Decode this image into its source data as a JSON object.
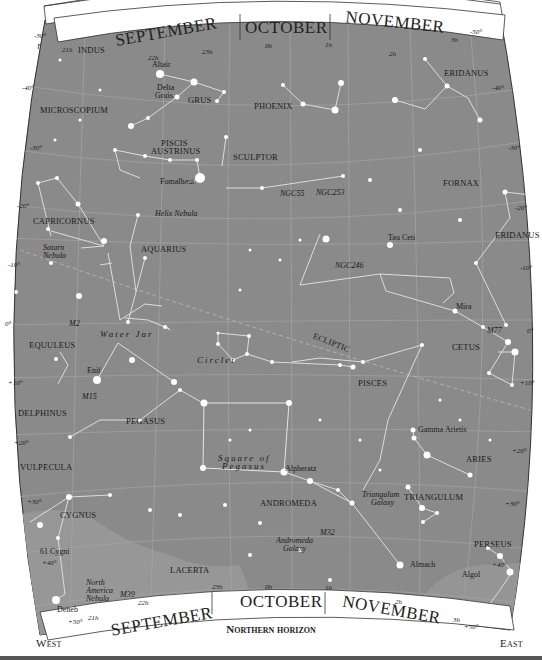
{
  "intro_text": [
    "rs at the",
    "the top",
    "lar",
    "h polar"
  ],
  "header": {
    "overhead": "Overhead"
  },
  "footer": {
    "horizon": "Northern horizon",
    "west": "West",
    "east": "East"
  },
  "months": {
    "top": [
      "SEPTEMBER",
      "OCTOBER",
      "NOVEMBER"
    ],
    "bottom": [
      "SEPTEMBER",
      "OCTOBER",
      "NOVEMBER"
    ]
  },
  "colors": {
    "sky": "#8a8a8a",
    "milky_way": "#9a9a9a",
    "lines": "#d8d8d8",
    "grid": "#a8a8a8",
    "star": "#ffffff",
    "banner": "#ffffff",
    "text": "#1a1a1a"
  },
  "ra_ticks": {
    "top": [
      "21h",
      "22h",
      "23h",
      "0h",
      "1h",
      "2h",
      "3h"
    ],
    "bottom": [
      "21h",
      "22h",
      "23h",
      "0h",
      "1h",
      "2h",
      "3h"
    ]
  },
  "dec_ticks": {
    "left": [
      "-30°",
      "-40°",
      "-30°",
      "-20°",
      "-10°",
      "0°",
      "+10°",
      "+20°",
      "+30°",
      "+40°",
      "+50°"
    ],
    "right": [
      "-50°",
      "-40°",
      "-30°",
      "-20°",
      "-10°",
      "0°",
      "+10°",
      "+20°",
      "+30°",
      "+40°",
      "+50°"
    ]
  },
  "constellations": [
    {
      "name": "INDUS",
      "x": 78,
      "y": 53
    },
    {
      "name": "GRUS",
      "x": 188,
      "y": 103
    },
    {
      "name": "PHOENIX",
      "x": 254,
      "y": 109
    },
    {
      "name": "ERIDANUS",
      "x": 445,
      "y": 76
    },
    {
      "name": "MICROSCOPIUM",
      "x": 40,
      "y": 113
    },
    {
      "name": "PISCIS",
      "x": 161,
      "y": 147
    },
    {
      "name": "AUSTRINUS",
      "x": 151,
      "y": 155
    },
    {
      "name": "SCULPTOR",
      "x": 233,
      "y": 160
    },
    {
      "name": "FORNAX",
      "x": 443,
      "y": 186
    },
    {
      "name": "CAPRICORNUS",
      "x": 33,
      "y": 224
    },
    {
      "name": "AQUARIUS",
      "x": 141,
      "y": 252
    },
    {
      "name": "ERIDANUS",
      "x": 495,
      "y": 238
    },
    {
      "name": "CETUS",
      "x": 452,
      "y": 350
    },
    {
      "name": "EQUULEUS",
      "x": 29,
      "y": 348
    },
    {
      "name": "PISCES",
      "x": 358,
      "y": 386
    },
    {
      "name": "DELPHINUS",
      "x": 18,
      "y": 416
    },
    {
      "name": "PEGASUS",
      "x": 126,
      "y": 424
    },
    {
      "name": "ARIES",
      "x": 466,
      "y": 462
    },
    {
      "name": "VULPECULA",
      "x": 20,
      "y": 470
    },
    {
      "name": "ANDROMEDA",
      "x": 260,
      "y": 506
    },
    {
      "name": "TRIANGULUM",
      "x": 404,
      "y": 500
    },
    {
      "name": "CYGNUS",
      "x": 60,
      "y": 518
    },
    {
      "name": "PERSEUS",
      "x": 474,
      "y": 547
    },
    {
      "name": "LACERTA",
      "x": 170,
      "y": 573
    }
  ],
  "deep_sky": [
    {
      "name": "NGC55",
      "x": 280,
      "y": 196
    },
    {
      "name": "NGC253",
      "x": 316,
      "y": 195
    },
    {
      "name": "Helix Nebula",
      "x": 155,
      "y": 216
    },
    {
      "name": "NGC246",
      "x": 335,
      "y": 268
    },
    {
      "name": "M77",
      "x": 487,
      "y": 333
    },
    {
      "name": "M2",
      "x": 69,
      "y": 323
    },
    {
      "name": "M15",
      "x": 82,
      "y": 396
    },
    {
      "name": "M32",
      "x": 320,
      "y": 533
    },
    {
      "name": "M39",
      "x": 120,
      "y": 596
    }
  ],
  "multiline_objects": [
    {
      "lines": [
        "Saturn",
        "Nebula"
      ],
      "x": 43,
      "y": 250
    },
    {
      "lines": [
        "Andromeda",
        "Galaxy"
      ],
      "x": 276,
      "y": 543
    },
    {
      "lines": [
        "Triangulum",
        "Galaxy"
      ],
      "x": 365,
      "y": 498
    },
    {
      "lines": [
        "North",
        "America",
        "Nebula"
      ],
      "x": 86,
      "y": 585
    }
  ],
  "star_names": [
    {
      "name": "Altair",
      "x": 152,
      "y": 67
    },
    {
      "name": "Fomalhaut",
      "x": 160,
      "y": 184
    },
    {
      "name": "Tau Ceti",
      "x": 388,
      "y": 240
    },
    {
      "name": "Mira",
      "x": 456,
      "y": 306
    },
    {
      "name": "Enif",
      "x": 87,
      "y": 373
    },
    {
      "name": "Gamma Arietis",
      "x": 418,
      "y": 432
    },
    {
      "name": "Alpheratz",
      "x": 285,
      "y": 471
    },
    {
      "name": "Almach",
      "x": 410,
      "y": 567
    },
    {
      "name": "Algol",
      "x": 462,
      "y": 577
    },
    {
      "name": "61 Cygni",
      "x": 40,
      "y": 554
    },
    {
      "name": "Deneb",
      "x": 57,
      "y": 612
    }
  ],
  "star_multiline": [
    {
      "lines": [
        "Delta",
        "Gruis"
      ],
      "x": 157,
      "y": 90
    }
  ],
  "patterns": [
    {
      "name": "Water Jar",
      "x": 100,
      "y": 337
    },
    {
      "name": "Circlet",
      "x": 197,
      "y": 363
    },
    {
      "name": "Square of",
      "x": 218,
      "y": 461
    },
    {
      "name": "Pegasus",
      "x": 222,
      "y": 469
    },
    {
      "name": "ECLIPTIC",
      "x": 311,
      "y": 345
    }
  ],
  "ui": {
    "chart_label": "Star chart: October evening sky, southern view"
  }
}
